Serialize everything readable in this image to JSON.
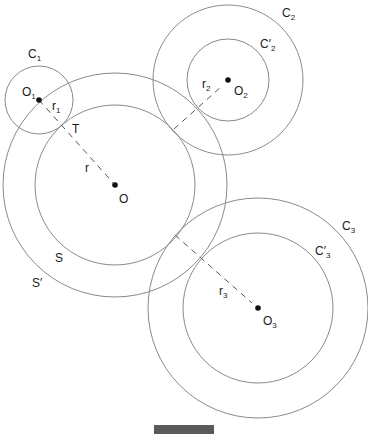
{
  "figure": {
    "type": "geometry-diagram",
    "stroke_color": "#8a8a8a",
    "dash_color": "#555555",
    "point_color": "#111111"
  },
  "centers": [
    {
      "id": "O",
      "label": "O",
      "sub": "",
      "x": 115,
      "y": 185
    },
    {
      "id": "O1",
      "label": "O",
      "sub": "1",
      "x": 39,
      "y": 100
    },
    {
      "id": "O2",
      "label": "O",
      "sub": "2",
      "x": 228,
      "y": 80
    },
    {
      "id": "O3",
      "label": "O",
      "sub": "3",
      "x": 258,
      "y": 308
    }
  ],
  "circles": [
    {
      "id": "S",
      "label": "S",
      "center": "O",
      "r": 80
    },
    {
      "id": "S_prime",
      "label": "S′",
      "center": "O",
      "r": 112
    },
    {
      "id": "C1",
      "label": "C",
      "sub": "1",
      "center": "O1",
      "r": 34
    },
    {
      "id": "C2",
      "label": "C",
      "sub": "2",
      "center": "O2",
      "r": 75
    },
    {
      "id": "C2_prime",
      "label": "C′",
      "sub": "2",
      "center": "O2",
      "r": 41
    },
    {
      "id": "C3",
      "label": "C",
      "sub": "3",
      "center": "O3",
      "r": 110
    },
    {
      "id": "C3_prime",
      "label": "C′",
      "sub": "3",
      "center": "O3",
      "r": 75
    }
  ],
  "radii": [
    {
      "id": "r",
      "label": "r",
      "sub": ""
    },
    {
      "id": "r1",
      "label": "r",
      "sub": "1"
    },
    {
      "id": "r2",
      "label": "r",
      "sub": "2"
    },
    {
      "id": "r3",
      "label": "r",
      "sub": "3"
    }
  ],
  "points": [
    {
      "id": "T",
      "label": "T"
    }
  ],
  "labels": {
    "C1": {
      "main": "C",
      "sub": "1"
    },
    "C2": {
      "main": "C",
      "sub": "2"
    },
    "C2p": {
      "main": "C′",
      "sub": "2"
    },
    "C3": {
      "main": "C",
      "sub": "3"
    },
    "C3p": {
      "main": "C′",
      "sub": "3"
    },
    "O": {
      "main": "O"
    },
    "O1": {
      "main": "O",
      "sub": "1"
    },
    "O2": {
      "main": "O",
      "sub": "2"
    },
    "O3": {
      "main": "O",
      "sub": "3"
    },
    "r": {
      "main": "r"
    },
    "r1": {
      "main": "r",
      "sub": "1"
    },
    "r2": {
      "main": "r",
      "sub": "2"
    },
    "r3": {
      "main": "r",
      "sub": "3"
    },
    "T": {
      "main": "T"
    },
    "S": {
      "main": "S"
    },
    "Sp": {
      "main": "S′"
    }
  },
  "caption_bar": {
    "color": "#5a5a5a"
  }
}
